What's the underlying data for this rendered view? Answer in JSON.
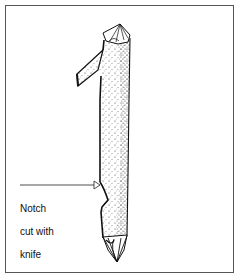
{
  "figure": {
    "annotation": {
      "line1": "Notch",
      "line2": "cut with",
      "line3": "knife"
    },
    "colors": {
      "ink": "#111111",
      "frame": "#555555",
      "background": "#ffffff"
    }
  }
}
